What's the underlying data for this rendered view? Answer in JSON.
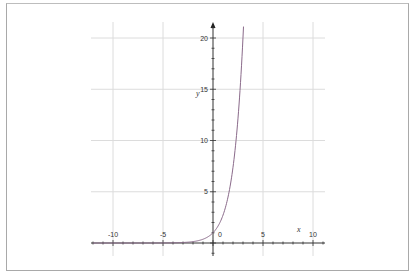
{
  "chart_data": {
    "type": "line",
    "title": "",
    "xlabel": "x",
    "ylabel": "y",
    "xlim": [
      -12.2,
      11.2
    ],
    "ylim": [
      -1.2,
      21.5
    ],
    "grid": true,
    "legend": null,
    "x_ticks": [
      -10,
      -5,
      0,
      5,
      10
    ],
    "y_ticks": [
      5,
      10,
      15,
      20
    ],
    "x_tick_labels": [
      "-10",
      "-5",
      "0",
      "5",
      "10"
    ],
    "y_tick_labels": [
      "5",
      "10",
      "15",
      "20"
    ],
    "series": [
      {
        "name": "y = e^x",
        "color": "#8a6a8a",
        "x": [
          -12,
          -10,
          -8,
          -6,
          -5,
          -4,
          -3,
          -2,
          -1,
          0,
          0.5,
          1,
          1.5,
          2,
          2.5,
          2.75,
          3,
          3.05
        ],
        "y": [
          6.1e-06,
          4.54e-05,
          0.000335,
          0.00248,
          0.0067,
          0.0183,
          0.0498,
          0.135,
          0.368,
          1,
          1.649,
          2.718,
          4.482,
          7.389,
          12.18,
          15.64,
          20.09,
          21.12
        ]
      }
    ]
  },
  "labels": {
    "x_axis_name": "x",
    "y_axis_name": "y",
    "x_ticks": [
      "-10",
      "-5",
      "0",
      "5",
      "10"
    ],
    "y_ticks": [
      "5",
      "10",
      "15",
      "20"
    ]
  }
}
